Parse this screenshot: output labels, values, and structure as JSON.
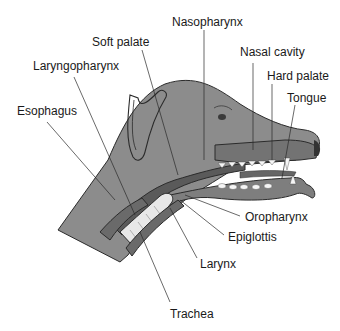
{
  "figure": {
    "labels": {
      "soft_palate": "Soft palate",
      "nasopharynx": "Nasopharynx",
      "nasal_cavity": "Nasal cavity",
      "laryngopharynx": "Laryngopharynx",
      "hard_palate": "Hard palate",
      "tongue": "Tongue",
      "esophagus": "Esophagus",
      "oropharynx": "Oropharynx",
      "epiglottis": "Epiglottis",
      "larynx": "Larynx",
      "trachea": "Trachea"
    },
    "colors": {
      "skin": "#8c8c8c",
      "skin_dark": "#6e6e6e",
      "tract_dark": "#5a5a5a",
      "tract_mid": "#7a7a7a",
      "cartilage_light": "#e8e8e8",
      "teeth": "#f5f5f5",
      "outline": "#2b2b2b",
      "background": "#ffffff"
    }
  }
}
